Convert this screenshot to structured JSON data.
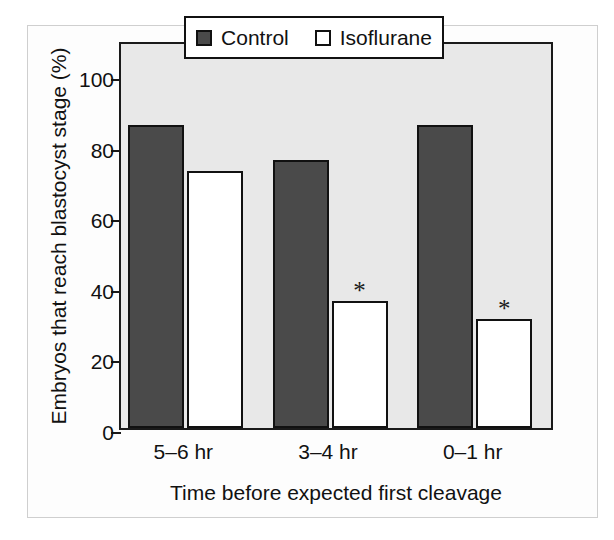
{
  "figure": {
    "kind": "bar-chart-figure",
    "background_color": "#ffffff",
    "plot_background_color": "#e8e8e8",
    "frame_color": "#1a1a1a"
  },
  "chart_data": {
    "type": "bar",
    "title": "",
    "xlabel": "Time before expected first cleavage",
    "ylabel": "Embryos that reach blastocyst stage (%)",
    "categories": [
      "5–6 hr",
      "3–4 hr",
      "0–1 hr"
    ],
    "series": [
      {
        "name": "Control",
        "color": "#4a4a4a",
        "values": [
          86,
          76,
          86
        ]
      },
      {
        "name": "Isoflurane",
        "color": "#ffffff",
        "values": [
          73,
          36,
          31
        ]
      }
    ],
    "ylim": [
      0,
      110
    ],
    "yticks": [
      0,
      20,
      40,
      60,
      80,
      100
    ],
    "ytick_labels": [
      "0",
      "20",
      "40",
      "60",
      "80",
      "100"
    ],
    "grid": false,
    "legend_position": "top-center",
    "annotations": [
      {
        "text": "*",
        "series": "Isoflurane",
        "category": "3–4 hr",
        "value": 36
      },
      {
        "text": "*",
        "series": "Isoflurane",
        "category": "0–1 hr",
        "value": 31
      }
    ]
  },
  "legend": {
    "entries": [
      {
        "label": "Control",
        "swatch": "filled-square-icon"
      },
      {
        "label": "Isoflurane",
        "swatch": "open-square-icon"
      }
    ]
  }
}
